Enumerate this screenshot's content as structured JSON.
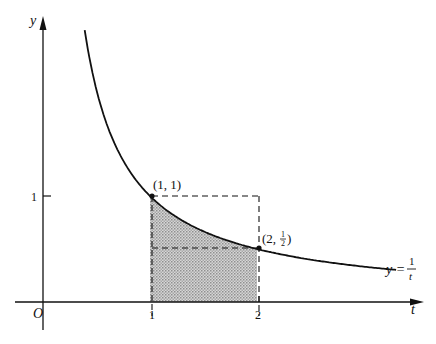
{
  "diagram": {
    "axes": {
      "x_label": "t",
      "y_label": "y",
      "origin_label": "O",
      "x_ticks": [
        {
          "value": 1,
          "label": "1"
        },
        {
          "value": 2,
          "label": "2"
        }
      ],
      "y_ticks": [
        {
          "value": 1,
          "label": "1"
        }
      ]
    },
    "curve": {
      "function": "1/t",
      "label_lhs": "y =",
      "label_num": "1",
      "label_den": "t",
      "t_range": [
        0.39,
        3.3
      ]
    },
    "points": [
      {
        "t": 1,
        "y": 1,
        "label": "(1, 1)"
      },
      {
        "t": 2,
        "y": 0.5,
        "label_prefix": "(2, ",
        "label_frac_num": "1",
        "label_frac_den": "2",
        "label_suffix": ")"
      }
    ],
    "shaded_region": {
      "from_t": 1,
      "to_t": 2,
      "description": "area under y=1/t from t=1 to t=2"
    },
    "dashed_rectangles": [
      {
        "from_t": 1,
        "to_t": 2,
        "height": 1
      },
      {
        "from_t": 1,
        "to_t": 2,
        "height": 0.5
      }
    ],
    "colors": {
      "ink": "#111111",
      "shade": "#bdbdbd"
    }
  }
}
